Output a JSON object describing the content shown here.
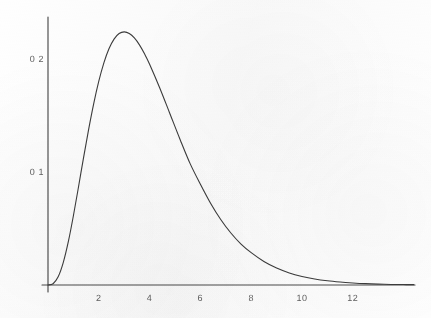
{
  "figure": {
    "background_color": "#fefefe",
    "ink_color": "#3c3c3c",
    "axis_color": "#4a4a4a"
  },
  "chart_data": {
    "type": "line",
    "title": "",
    "subtitle": "",
    "xlabel": "",
    "ylabel": "",
    "xlim": [
      -0.3,
      14.4
    ],
    "ylim": [
      0,
      0.238
    ],
    "grid": false,
    "legend": null,
    "legend_position": "none",
    "x_ticks": [
      2,
      4,
      6,
      8,
      10,
      12
    ],
    "x_tick_labels": [
      "2",
      "4",
      "6",
      "8",
      "10",
      "12"
    ],
    "y_ticks": [
      0.1,
      0.2
    ],
    "y_tick_labels": [
      "0 1",
      "0 2"
    ],
    "peak": {
      "x": 3.0,
      "y": 0.233
    },
    "series": [
      {
        "name": "density",
        "x": [
          0.0,
          0.2,
          0.4,
          0.6,
          0.8,
          1.0,
          1.2,
          1.4,
          1.6,
          1.8,
          2.0,
          2.2,
          2.4,
          2.6,
          2.8,
          3.0,
          3.2,
          3.4,
          3.6,
          3.8,
          4.0,
          4.4,
          4.8,
          5.2,
          5.6,
          6.0,
          6.4,
          6.8,
          7.2,
          7.6,
          8.0,
          8.5,
          9.0,
          9.5,
          10.0,
          10.5,
          11.0,
          11.5,
          12.0,
          12.5,
          13.0,
          13.5,
          14.0,
          14.4
        ],
        "y": [
          0.0,
          0.0011,
          0.0072,
          0.0198,
          0.0383,
          0.0613,
          0.0867,
          0.1128,
          0.1378,
          0.1606,
          0.1804,
          0.1966,
          0.209,
          0.2176,
          0.2225,
          0.224,
          0.2226,
          0.2186,
          0.2125,
          0.2046,
          0.1954,
          0.1744,
          0.1516,
          0.1288,
          0.1072,
          0.0892,
          0.0724,
          0.058,
          0.046,
          0.0362,
          0.0286,
          0.0208,
          0.015,
          0.0107,
          0.0076,
          0.0053,
          0.0037,
          0.0026,
          0.0018,
          0.0012,
          0.0008,
          0.0005,
          0.0004,
          0.0003
        ],
        "color": "#3c3c3c",
        "line_width": 1.1,
        "style": "solid"
      }
    ],
    "axes": {
      "x_axis_drawn": true,
      "y_axis_drawn": true,
      "x_axis_origin_value": 0,
      "x_axis_end_value": 14.4,
      "y_axis_top_value": 0.238,
      "ticks_visible": false,
      "spines": [
        "left",
        "bottom"
      ]
    },
    "pixel_geometry": {
      "x_origin_px": 48,
      "x_end_px": 415,
      "y_baseline_px": 285,
      "y_top_px": 17,
      "px_per_x_unit": 25.4,
      "px_per_y_unit": 1130
    }
  }
}
